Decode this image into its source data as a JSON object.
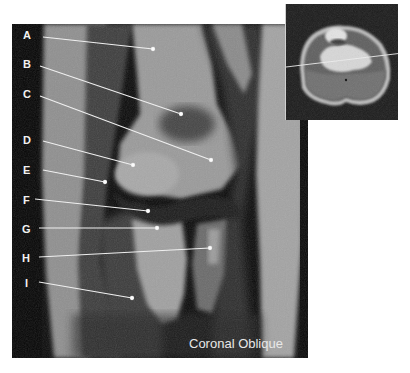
{
  "figure": {
    "view_caption": "Coronal Oblique",
    "labels": [
      {
        "letter": "A",
        "x": 23,
        "y": 29,
        "line": [
          43,
          37,
          153,
          49
        ]
      },
      {
        "letter": "B",
        "x": 23,
        "y": 58,
        "line": [
          40,
          66,
          181,
          114
        ]
      },
      {
        "letter": "C",
        "x": 23,
        "y": 88,
        "line": [
          40,
          96,
          211,
          160
        ]
      },
      {
        "letter": "D",
        "x": 23,
        "y": 134,
        "line": [
          43,
          141,
          133,
          165
        ]
      },
      {
        "letter": "E",
        "x": 23,
        "y": 164,
        "line": [
          43,
          170,
          105,
          182
        ]
      },
      {
        "letter": "F",
        "x": 23,
        "y": 194,
        "line": [
          35,
          199,
          148,
          211
        ]
      },
      {
        "letter": "G",
        "x": 22,
        "y": 223,
        "line": [
          39,
          228,
          157,
          228
        ]
      },
      {
        "letter": "H",
        "x": 22,
        "y": 252,
        "line": [
          39,
          257,
          210,
          248
        ]
      },
      {
        "letter": "I",
        "x": 25,
        "y": 277,
        "line": [
          39,
          282,
          132,
          298
        ]
      }
    ],
    "inset": {
      "description": "axial reference image with slice line",
      "slice_line": [
        0,
        63,
        117,
        49
      ]
    },
    "colors": {
      "background": "#ffffff",
      "image_black": "#0a0a0a",
      "label_text": "#f2f2f2",
      "pointer_line": "#f0f0f0"
    }
  }
}
